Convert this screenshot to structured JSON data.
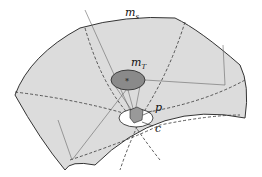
{
  "labels": {
    "surface": {
      "main": "m",
      "sub": "s"
    },
    "tangent_object": {
      "main": "m",
      "sub": "T"
    },
    "point": "p",
    "center": "c"
  },
  "colors": {
    "surface_fill": "#dcdcdc",
    "ellipse_fill": "#8a8a8a",
    "white_patch": "#ffffff",
    "line": "#333333"
  }
}
